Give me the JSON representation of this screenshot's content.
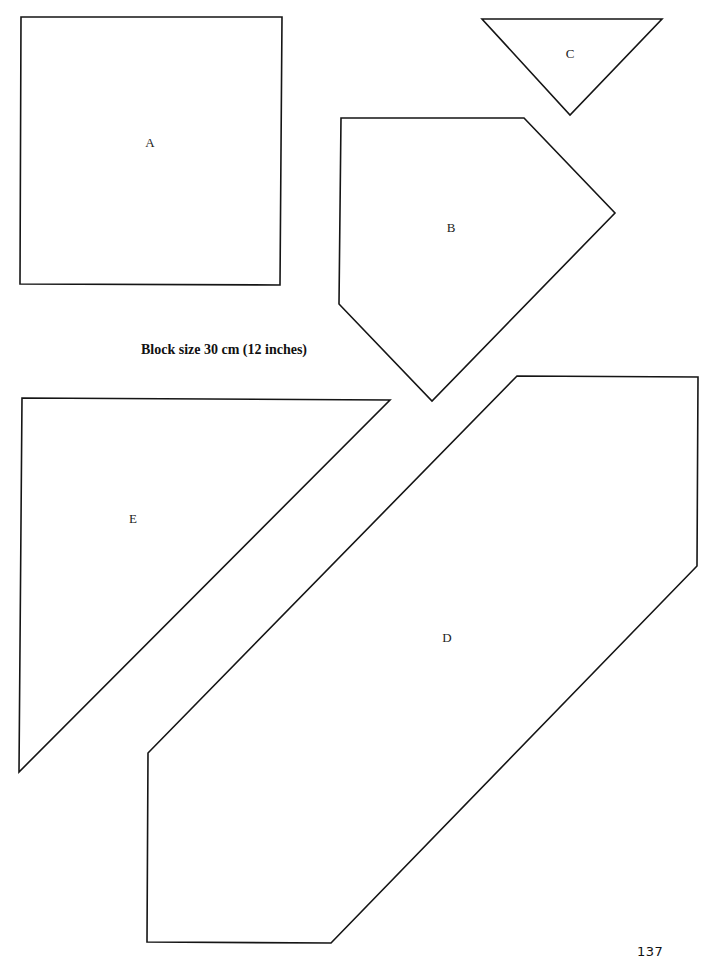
{
  "page": {
    "heading": "Block size 30 cm (12 inches)",
    "page_number": "137",
    "stroke_color": "#151515",
    "background": "#ffffff"
  },
  "pieces": [
    {
      "id": "A",
      "label": "A",
      "shape": "square",
      "points": "21,17 282,17 280,285 20,284",
      "label_pos": [
        150,
        142
      ]
    },
    {
      "id": "B",
      "label": "B",
      "shape": "pentagon",
      "points": "341,118 524,118 615,213 432,401 339,304",
      "label_pos": [
        451,
        227
      ]
    },
    {
      "id": "C",
      "label": "C",
      "shape": "triangle",
      "points": "482,19 662,19 570,115",
      "label_pos": [
        570,
        53
      ]
    },
    {
      "id": "D",
      "label": "D",
      "shape": "hexagon",
      "points": "517,376 698,377 697,566 331,943 147,942 148,753",
      "label_pos": [
        447,
        637
      ]
    },
    {
      "id": "E",
      "label": "E",
      "shape": "triangle",
      "points": "22,398 390,400 19,772",
      "label_pos": [
        133,
        518
      ]
    }
  ]
}
